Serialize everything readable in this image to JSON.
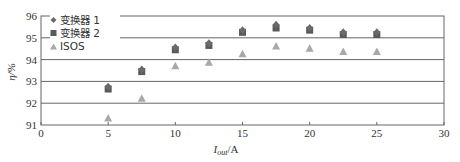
{
  "chart_data": {
    "type": "scatter",
    "title": "",
    "xlabel": "I_out/A",
    "xlabel_main": "I",
    "xlabel_sub": "out",
    "xlabel_suffix": "/A",
    "ylabel": "η/%",
    "xlim": [
      0,
      30
    ],
    "ylim": [
      91,
      96
    ],
    "xticks": [
      0,
      5,
      10,
      15,
      20,
      25,
      30
    ],
    "yticks": [
      91,
      92,
      93,
      94,
      95,
      96
    ],
    "grid": "horizontal",
    "legend_position": "upper-left",
    "series": [
      {
        "name": "变换器 1",
        "marker": "diamond",
        "color": "#6a6a6a",
        "x": [
          5,
          7.5,
          10,
          12.5,
          15,
          17.5,
          20,
          22.5,
          25
        ],
        "y": [
          92.75,
          93.55,
          94.55,
          94.75,
          95.35,
          95.6,
          95.45,
          95.25,
          95.25
        ]
      },
      {
        "name": "变换器 2",
        "marker": "square",
        "color": "#5a5a5a",
        "x": [
          5,
          7.5,
          10,
          12.5,
          15,
          17.5,
          20,
          22.5,
          25
        ],
        "y": [
          92.65,
          93.45,
          94.45,
          94.65,
          95.25,
          95.45,
          95.35,
          95.15,
          95.15
        ]
      },
      {
        "name": "ISOS",
        "marker": "triangle",
        "color": "#a8a8a8",
        "x": [
          5,
          7.5,
          10,
          12.5,
          15,
          17.5,
          20,
          22.5,
          25
        ],
        "y": [
          91.3,
          92.2,
          93.7,
          93.85,
          94.25,
          94.6,
          94.5,
          94.35,
          94.35
        ]
      }
    ]
  },
  "legend": {
    "item1": "变换器 1",
    "item2": "变换器 2",
    "item3": "ISOS"
  }
}
